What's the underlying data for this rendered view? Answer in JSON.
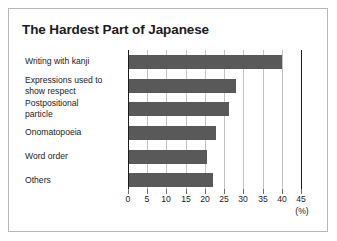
{
  "chart_data": {
    "type": "bar",
    "orientation": "horizontal",
    "title": "The Hardest Part of Japanese",
    "xlabel": "(%)",
    "ylabel": "",
    "categories": [
      "Writing with kanji",
      "Expressions used to\nshow respect",
      "Postpositional\nparticle",
      "Onomatopoeia",
      "Word order",
      "Others"
    ],
    "values": [
      40,
      28,
      26.4,
      22.8,
      20.5,
      22
    ],
    "xlim": [
      0,
      45
    ],
    "xticks": [
      0,
      5,
      10,
      15,
      20,
      25,
      30,
      35,
      40,
      45
    ],
    "xtick_labels": [
      "0",
      "5",
      "10",
      "15",
      "20",
      "25",
      "30",
      "35",
      "40",
      "45"
    ],
    "grid": "vertical",
    "legend": null,
    "bar_color": "#595959",
    "axis_color": "#1d1d1d",
    "gridline_color": "#c3c3c3",
    "frame_color": "#b9b9b9",
    "background": "#ffffff",
    "unit_note": "(%)"
  }
}
